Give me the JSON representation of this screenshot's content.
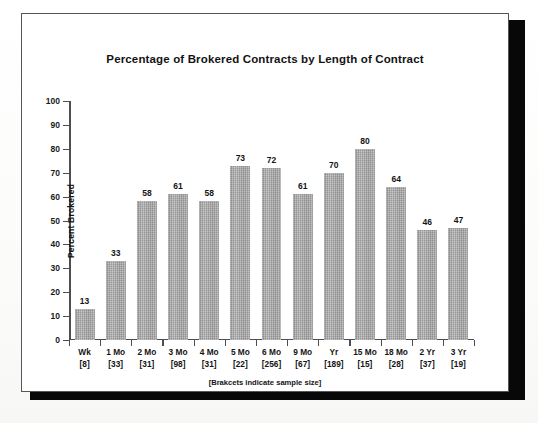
{
  "chart_data": {
    "type": "bar",
    "title": "Percentage of Brokered Contracts by Length of Contract",
    "xlabel": "",
    "ylabel": "Percent Brokered",
    "footnote": "[Brakcets indicate sample size]",
    "ylim": [
      0,
      100
    ],
    "ytick_step": 10,
    "ytick_labels": [
      "100",
      "90",
      "80",
      "70",
      "60",
      "50",
      "40",
      "30",
      "20",
      "10",
      "0"
    ],
    "grid": false,
    "legend": "none",
    "bar_color": "#a9a9a9",
    "categories": [
      "Wk [8]",
      "1 Mo [33]",
      "2 Mo [31]",
      "3 Mo [98]",
      "4 Mo [31]",
      "5 Mo [22]",
      "6 Mo [256]",
      "9 Mo [67]",
      "Yr [189]",
      "15 Mo [15]",
      "18 Mo [28]",
      "2 Yr [37]",
      "3 Yr [19]"
    ],
    "category_parts": [
      {
        "term": "Wk",
        "sample": "[8]"
      },
      {
        "term": "1 Mo",
        "sample": "[33]"
      },
      {
        "term": "2 Mo",
        "sample": "[31]"
      },
      {
        "term": "3 Mo",
        "sample": "[98]"
      },
      {
        "term": "4 Mo",
        "sample": "[31]"
      },
      {
        "term": "5 Mo",
        "sample": "[22]"
      },
      {
        "term": "6 Mo",
        "sample": "[256]"
      },
      {
        "term": "9 Mo",
        "sample": "[67]"
      },
      {
        "term": "Yr",
        "sample": "[189]"
      },
      {
        "term": "15 Mo",
        "sample": "[15]"
      },
      {
        "term": "18 Mo",
        "sample": "[28]"
      },
      {
        "term": "2 Yr",
        "sample": "[37]"
      },
      {
        "term": "3 Yr",
        "sample": "[19]"
      }
    ],
    "values": [
      13,
      33,
      58,
      61,
      58,
      73,
      72,
      61,
      70,
      80,
      64,
      46,
      47
    ],
    "sample_sizes": [
      8,
      33,
      31,
      98,
      31,
      22,
      256,
      67,
      189,
      15,
      28,
      37,
      19
    ]
  }
}
